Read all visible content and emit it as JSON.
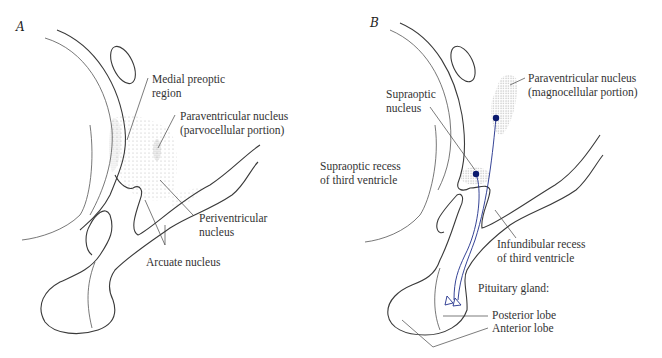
{
  "figure": {
    "panels": [
      {
        "letter": "A",
        "labels": {
          "medial_preoptic": "Medial preoptic\nregion",
          "pvn_parvo": "Paraventricular nucleus\n(parvocellular portion)",
          "periventricular": "Periventricular\nnucleus",
          "arcuate": "Arcuate nucleus"
        }
      },
      {
        "letter": "B",
        "labels": {
          "supraoptic_nucleus": "Supraoptic\nnucleus",
          "pvn_magno": "Paraventricular nucleus\n(magnocellular portion)",
          "supraoptic_recess": "Supraoptic recess\nof third ventricle",
          "infundibular_recess": "Infundibular recess\nof third ventricle",
          "pituitary": "Pituitary gland:",
          "posterior_lobe": "Posterior lobe",
          "anterior_lobe": "Anterior lobe"
        }
      }
    ],
    "colors": {
      "outline": "#3a3a3a",
      "neuron": "#0a1a6e",
      "axon": "#1f2f8a",
      "stipple": "#bdbdbd"
    }
  }
}
